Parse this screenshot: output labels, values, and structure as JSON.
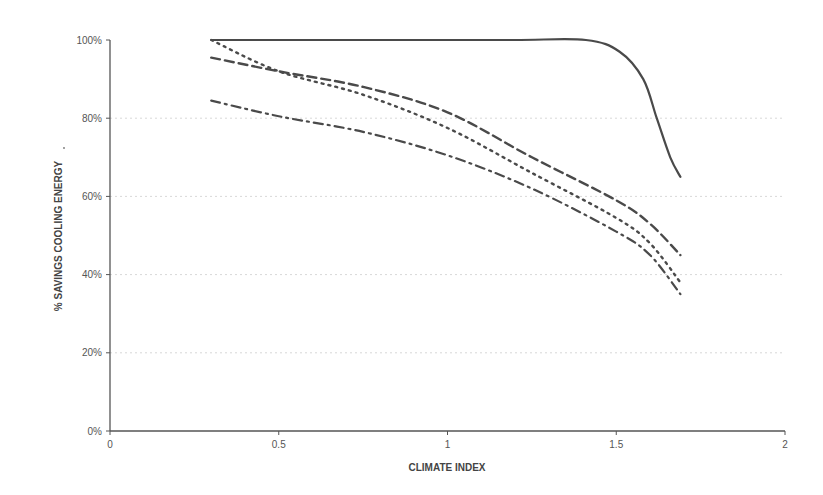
{
  "chart_data": {
    "type": "line",
    "title": "",
    "xlabel": "CLIMATE INDEX",
    "ylabel": "% SAVINGS COOLING ENERGY",
    "xlim": [
      0,
      2
    ],
    "ylim": [
      0,
      100
    ],
    "x_ticks": [
      "0",
      "0.5",
      "1",
      "1.5",
      "2"
    ],
    "y_ticks": [
      "0%",
      "20%",
      "40%",
      "60%",
      "80%",
      "100%"
    ],
    "grid": {
      "horizontal": true,
      "style": "dotted-faint"
    },
    "legend": null,
    "series": [
      {
        "name": "solid",
        "line_style": "solid",
        "x": [
          0.3,
          0.6,
          0.9,
          1.2,
          1.41,
          1.51,
          1.58,
          1.62,
          1.66,
          1.69
        ],
        "y": [
          100,
          100,
          100,
          100,
          100,
          97,
          90,
          80,
          70,
          65
        ]
      },
      {
        "name": "long-dash",
        "line_style": "dashed",
        "x": [
          0.3,
          0.5,
          0.75,
          1.0,
          1.25,
          1.5,
          1.6,
          1.69
        ],
        "y": [
          95.5,
          92,
          88,
          81.5,
          70,
          59,
          53,
          45
        ]
      },
      {
        "name": "dotted",
        "line_style": "dotted",
        "x": [
          0.3,
          0.5,
          0.75,
          1.0,
          1.25,
          1.5,
          1.6,
          1.69
        ],
        "y": [
          100,
          92,
          86,
          77.5,
          66,
          54.5,
          48,
          38
        ]
      },
      {
        "name": "dash-dot",
        "line_style": "dash-dot",
        "x": [
          0.3,
          0.5,
          0.75,
          1.0,
          1.25,
          1.5,
          1.6,
          1.69
        ],
        "y": [
          84.5,
          80.5,
          76.5,
          70.5,
          62,
          51,
          45,
          35
        ]
      }
    ]
  },
  "axes": {
    "xlabel": "CLIMATE INDEX",
    "ylabel": "% SAVINGS COOLING ENERGY",
    "ylabel_suffix": "."
  }
}
